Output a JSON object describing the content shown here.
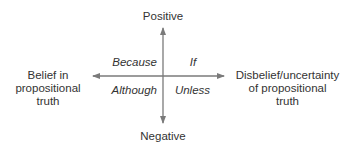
{
  "axes": {
    "top": "Positive",
    "bottom": "Negative",
    "left": [
      "Belief in",
      "propositional",
      "truth"
    ],
    "right": [
      "Disbelief/uncertainty",
      "of propositional",
      "truth"
    ]
  },
  "quadrants": {
    "top_left": "Because",
    "top_right": "If",
    "bottom_left": "Although",
    "bottom_right": "Unless"
  },
  "colors": {
    "axis": "#7a7a7a",
    "text": "#333333"
  }
}
